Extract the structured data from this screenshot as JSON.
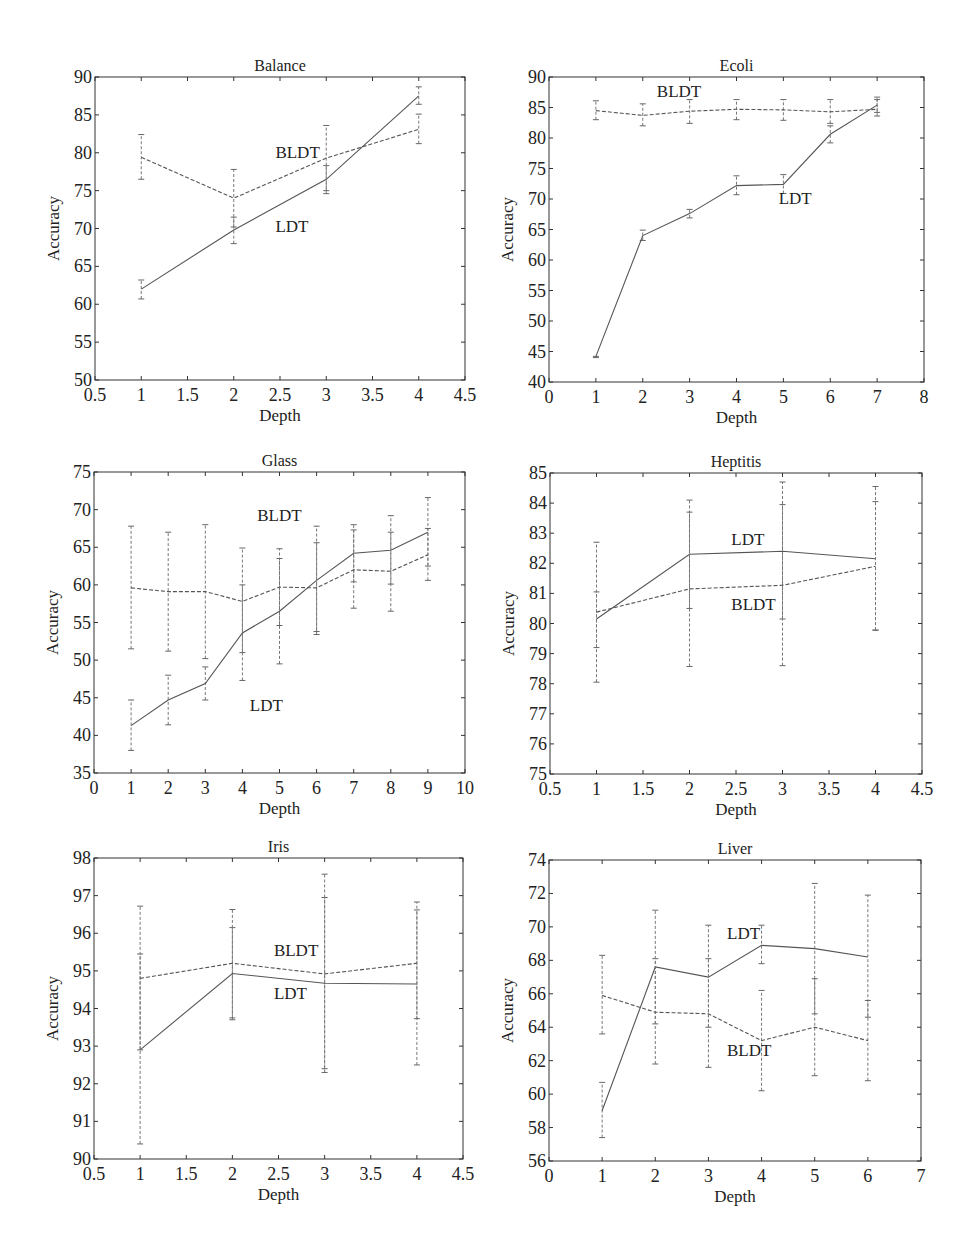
{
  "figure": {
    "background": "#ffffff",
    "line_color": "#555555",
    "axis_color": "#333333"
  },
  "chart_data": [
    {
      "type": "line",
      "title": "Balance",
      "xlabel": "Depth",
      "ylabel": "Accuracy",
      "xlim": [
        0.5,
        4.5
      ],
      "ylim": [
        50,
        90
      ],
      "xticks": [
        0.5,
        1,
        1.5,
        2,
        2.5,
        3,
        3.5,
        4,
        4.5
      ],
      "xtick_labels": [
        "0.5",
        "1",
        "1.5",
        "2",
        "2.5",
        "3",
        "3.5",
        "4",
        "4.5"
      ],
      "yticks": [
        50,
        55,
        60,
        65,
        70,
        75,
        80,
        85,
        90
      ],
      "ytick_labels": [
        "50",
        "55",
        "60",
        "65",
        "70",
        "75",
        "80",
        "85",
        "90"
      ],
      "grid": false,
      "plot_box": {
        "left": 95,
        "top": 77,
        "right": 465,
        "bottom": 380
      },
      "series": [
        {
          "name": "LDT",
          "style": "solid",
          "x": [
            1,
            2,
            3,
            4
          ],
          "values": [
            62.0,
            69.8,
            76.5,
            87.5
          ],
          "err_low": [
            60.7,
            68.0,
            74.6,
            86.4
          ],
          "err_high": [
            63.2,
            71.5,
            78.3,
            88.7
          ]
        },
        {
          "name": "BLDT",
          "style": "dashed",
          "x": [
            1,
            2,
            3,
            4
          ],
          "values": [
            79.4,
            74.0,
            79.3,
            83.1
          ],
          "err_low": [
            76.5,
            70.2,
            75.0,
            81.2
          ],
          "err_high": [
            82.4,
            77.8,
            83.6,
            85.1
          ]
        }
      ],
      "annotations": [
        {
          "text": "BLDT",
          "x": 2.45,
          "y": 79.3
        },
        {
          "text": "LDT",
          "x": 2.45,
          "y": 69.5
        }
      ]
    },
    {
      "type": "line",
      "title": "Ecoli",
      "xlabel": "Depth",
      "ylabel": "Accuracy",
      "xlim": [
        0,
        8
      ],
      "ylim": [
        40,
        90
      ],
      "xticks": [
        0,
        1,
        2,
        3,
        4,
        5,
        6,
        7,
        8
      ],
      "xtick_labels": [
        "0",
        "1",
        "2",
        "3",
        "4",
        "5",
        "6",
        "7",
        "8"
      ],
      "yticks": [
        40,
        45,
        50,
        55,
        60,
        65,
        70,
        75,
        80,
        85,
        90
      ],
      "ytick_labels": [
        "40",
        "45",
        "50",
        "55",
        "60",
        "65",
        "70",
        "75",
        "80",
        "85",
        "90"
      ],
      "grid": false,
      "plot_box": {
        "left": 549,
        "top": 77,
        "right": 924,
        "bottom": 382
      },
      "series": [
        {
          "name": "LDT",
          "style": "solid",
          "x": [
            1,
            2,
            3,
            4,
            5,
            6,
            7
          ],
          "values": [
            44.2,
            64.0,
            67.6,
            72.2,
            72.4,
            80.6,
            85.4
          ],
          "err_low": [
            44.0,
            63.2,
            66.9,
            70.7,
            70.9,
            79.2,
            84.2
          ],
          "err_high": [
            44.2,
            64.9,
            68.3,
            73.8,
            74.0,
            82.0,
            86.3
          ]
        },
        {
          "name": "BLDT",
          "style": "dashed",
          "x": [
            1,
            2,
            3,
            4,
            5,
            6,
            7
          ],
          "values": [
            84.5,
            83.7,
            84.4,
            84.7,
            84.6,
            84.3,
            84.7
          ],
          "err_low": [
            83.0,
            82.0,
            82.4,
            83.0,
            82.9,
            82.4,
            83.6
          ],
          "err_high": [
            86.1,
            85.6,
            86.3,
            86.3,
            86.3,
            86.3,
            86.7
          ]
        }
      ],
      "annotations": [
        {
          "text": "BLDT",
          "x": 2.3,
          "y": 86.8
        },
        {
          "text": "LDT",
          "x": 4.9,
          "y": 69.2
        }
      ]
    },
    {
      "type": "line",
      "title": "Glass",
      "xlabel": "Depth",
      "ylabel": "Accuracy",
      "xlim": [
        0,
        10
      ],
      "ylim": [
        35,
        75
      ],
      "xticks": [
        0,
        1,
        2,
        3,
        4,
        5,
        6,
        7,
        8,
        9,
        10
      ],
      "xtick_labels": [
        "0",
        "1",
        "2",
        "3",
        "4",
        "5",
        "6",
        "7",
        "8",
        "9",
        "10"
      ],
      "yticks": [
        35,
        40,
        45,
        50,
        55,
        60,
        65,
        70,
        75
      ],
      "ytick_labels": [
        "35",
        "40",
        "45",
        "50",
        "55",
        "60",
        "65",
        "70",
        "75"
      ],
      "grid": false,
      "plot_box": {
        "left": 94,
        "top": 472,
        "right": 465,
        "bottom": 773
      },
      "series": [
        {
          "name": "LDT",
          "style": "solid",
          "x": [
            1,
            2,
            3,
            4,
            5,
            6,
            7,
            8,
            9
          ],
          "values": [
            41.3,
            44.7,
            46.9,
            53.6,
            56.5,
            60.6,
            64.2,
            64.6,
            67.0
          ],
          "err_low": [
            38.0,
            41.4,
            44.7,
            47.3,
            49.5,
            53.4,
            60.4,
            60.1,
            62.5
          ],
          "err_high": [
            44.7,
            48.0,
            49.1,
            60.0,
            63.5,
            65.6,
            67.3,
            67.0,
            71.6
          ]
        },
        {
          "name": "BLDT",
          "style": "dashed",
          "x": [
            1,
            2,
            3,
            4,
            5,
            6,
            7,
            8,
            9
          ],
          "values": [
            59.6,
            59.1,
            59.1,
            57.8,
            59.7,
            59.6,
            62.0,
            61.8,
            64.0
          ],
          "err_low": [
            51.5,
            51.2,
            50.2,
            51.0,
            54.6,
            53.8,
            56.9,
            56.5,
            60.6
          ],
          "err_high": [
            67.8,
            67.0,
            68.0,
            64.9,
            64.8,
            67.8,
            68.0,
            69.2,
            67.5
          ]
        }
      ],
      "annotations": [
        {
          "text": "BLDT",
          "x": 4.4,
          "y": 68.5
        },
        {
          "text": "LDT",
          "x": 4.2,
          "y": 43.3
        }
      ]
    },
    {
      "type": "line",
      "title": "Heptitis",
      "xlabel": "Depth",
      "ylabel": "Accuracy",
      "xlim": [
        0.5,
        4.5
      ],
      "ylim": [
        75,
        85
      ],
      "xticks": [
        0.5,
        1,
        1.5,
        2,
        2.5,
        3,
        3.5,
        4,
        4.5
      ],
      "xtick_labels": [
        "0.5",
        "1",
        "1.5",
        "2",
        "2.5",
        "3",
        "3.5",
        "4",
        "4.5"
      ],
      "yticks": [
        75,
        76,
        77,
        78,
        79,
        80,
        81,
        82,
        83,
        84,
        85
      ],
      "ytick_labels": [
        "75",
        "76",
        "77",
        "78",
        "79",
        "80",
        "81",
        "82",
        "83",
        "84",
        "85"
      ],
      "grid": false,
      "plot_box": {
        "left": 550,
        "top": 473,
        "right": 922,
        "bottom": 774
      },
      "series": [
        {
          "name": "LDT",
          "style": "solid",
          "x": [
            1,
            2,
            3,
            4
          ],
          "values": [
            80.15,
            82.3,
            82.4,
            82.15
          ],
          "err_low": [
            78.05,
            80.5,
            80.15,
            79.78
          ],
          "err_high": [
            81.05,
            84.1,
            84.7,
            84.55
          ]
        },
        {
          "name": "BLDT",
          "style": "dashed",
          "x": [
            1,
            2,
            3,
            4
          ],
          "values": [
            80.38,
            81.15,
            81.27,
            81.9
          ],
          "err_low": [
            79.2,
            78.57,
            78.6,
            79.78
          ],
          "err_high": [
            82.7,
            83.7,
            83.95,
            84.05
          ]
        }
      ],
      "annotations": [
        {
          "text": "LDT",
          "x": 2.45,
          "y": 82.6
        },
        {
          "text": "BLDT",
          "x": 2.45,
          "y": 80.45
        }
      ]
    },
    {
      "type": "line",
      "title": "Iris",
      "xlabel": "Depth",
      "ylabel": "Accuracy",
      "xlim": [
        0.5,
        4.5
      ],
      "ylim": [
        90,
        98
      ],
      "xticks": [
        0.5,
        1,
        1.5,
        2,
        2.5,
        3,
        3.5,
        4,
        4.5
      ],
      "xtick_labels": [
        "0.5",
        "1",
        "1.5",
        "2",
        "2.5",
        "3",
        "3.5",
        "4",
        "4.5"
      ],
      "yticks": [
        90,
        91,
        92,
        93,
        94,
        95,
        96,
        97,
        98
      ],
      "ytick_labels": [
        "90",
        "91",
        "92",
        "93",
        "94",
        "95",
        "96",
        "97",
        "98"
      ],
      "grid": false,
      "plot_box": {
        "left": 94,
        "top": 858,
        "right": 463,
        "bottom": 1159
      },
      "series": [
        {
          "name": "LDT",
          "style": "solid",
          "x": [
            1,
            2,
            3,
            4
          ],
          "values": [
            92.9,
            94.93,
            94.67,
            94.65
          ],
          "err_low": [
            90.4,
            93.7,
            92.4,
            92.5
          ],
          "err_high": [
            95.45,
            96.15,
            96.95,
            96.62
          ]
        },
        {
          "name": "BLDT",
          "style": "dashed",
          "x": [
            1,
            2,
            3,
            4
          ],
          "values": [
            94.8,
            95.2,
            94.92,
            95.2
          ],
          "err_low": [
            92.9,
            93.75,
            92.3,
            93.73
          ],
          "err_high": [
            96.72,
            96.63,
            97.57,
            96.83
          ]
        }
      ],
      "annotations": [
        {
          "text": "BLDT",
          "x": 2.45,
          "y": 95.4
        },
        {
          "text": "LDT",
          "x": 2.45,
          "y": 94.25
        }
      ]
    },
    {
      "type": "line",
      "title": "Liver",
      "xlabel": "Depth",
      "ylabel": "Accuracy",
      "xlim": [
        0,
        7
      ],
      "ylim": [
        56,
        74
      ],
      "xticks": [
        0,
        1,
        2,
        3,
        4,
        5,
        6,
        7
      ],
      "xtick_labels": [
        "0",
        "1",
        "2",
        "3",
        "4",
        "5",
        "6",
        "7"
      ],
      "yticks": [
        56,
        58,
        60,
        62,
        64,
        66,
        68,
        70,
        72,
        74
      ],
      "ytick_labels": [
        "56",
        "58",
        "60",
        "62",
        "64",
        "66",
        "68",
        "70",
        "72",
        "74"
      ],
      "grid": false,
      "plot_box": {
        "left": 549,
        "top": 860,
        "right": 921,
        "bottom": 1161
      },
      "series": [
        {
          "name": "LDT",
          "style": "solid",
          "x": [
            1,
            2,
            3,
            4,
            5,
            6
          ],
          "values": [
            59.0,
            67.6,
            67.0,
            68.9,
            68.7,
            68.2
          ],
          "err_low": [
            57.4,
            64.2,
            64.0,
            67.8,
            64.8,
            64.6
          ],
          "err_high": [
            60.7,
            71.0,
            70.1,
            70.1,
            72.6,
            71.9
          ]
        },
        {
          "name": "BLDT",
          "style": "dashed",
          "x": [
            1,
            2,
            3,
            4,
            5,
            6
          ],
          "values": [
            65.9,
            64.9,
            64.8,
            63.2,
            64.0,
            63.2
          ],
          "err_low": [
            63.6,
            61.8,
            61.6,
            60.2,
            61.1,
            60.8
          ],
          "err_high": [
            68.3,
            68.1,
            68.1,
            66.2,
            66.9,
            65.6
          ]
        }
      ],
      "annotations": [
        {
          "text": "LDT",
          "x": 3.35,
          "y": 69.3
        },
        {
          "text": "BLDT",
          "x": 3.35,
          "y": 62.3
        }
      ]
    }
  ]
}
